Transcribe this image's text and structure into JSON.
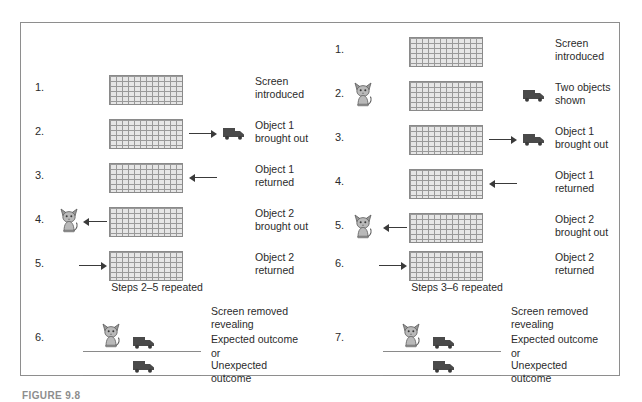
{
  "figure": {
    "caption": "FIGURE 9.8",
    "border_color": "#8e8e8e",
    "background": "#ffffff",
    "ink_color": "#2b2b2b",
    "object_color": "#4a4a4a",
    "screen_fill": "#e6e6e6"
  },
  "panels": [
    {
      "id": "left",
      "name": "one-object-sequence",
      "steps": [
        {
          "num": "1.",
          "caption": "Screen\nintroduced",
          "has_screen": true,
          "has_cat": false,
          "arrow": "none",
          "has_truck": false
        },
        {
          "num": "2.",
          "caption": "Object 1\nbrought out",
          "has_screen": true,
          "has_cat": false,
          "arrow": "out-right",
          "has_truck": true
        },
        {
          "num": "3.",
          "caption": "Object 1\nreturned",
          "has_screen": true,
          "has_cat": false,
          "arrow": "in-left",
          "has_truck": false
        },
        {
          "num": "4.",
          "caption": "Object 2\nbrought out",
          "has_screen": true,
          "has_cat": true,
          "arrow": "out-left",
          "has_truck": false
        },
        {
          "num": "5.",
          "caption": "Object 2\nreturned",
          "has_screen": true,
          "has_cat": false,
          "arrow": "in-right",
          "has_truck": false
        }
      ],
      "repeat_note": "Steps 2–5 repeated",
      "outcome": {
        "num": "6.",
        "caption_top": "Screen removed\nrevealing",
        "caption_expected": "Expected outcome",
        "caption_or": "or",
        "caption_unexpected": "Unexpected\noutcome",
        "expected_has_cat": true,
        "expected_has_truck": true,
        "unexpected_has_cat": false,
        "unexpected_has_truck": true
      }
    },
    {
      "id": "right",
      "name": "two-object-sequence",
      "steps": [
        {
          "num": "1.",
          "caption": "Screen\nintroduced",
          "has_screen": true,
          "has_cat": false,
          "arrow": "none",
          "has_truck": false
        },
        {
          "num": "2.",
          "caption": "Two objects\nshown",
          "has_screen": true,
          "has_cat": true,
          "arrow": "none",
          "has_truck": true
        },
        {
          "num": "3.",
          "caption": "Object 1\nbrought out",
          "has_screen": true,
          "has_cat": false,
          "arrow": "out-right",
          "has_truck": true
        },
        {
          "num": "4.",
          "caption": "Object 1\nreturned",
          "has_screen": true,
          "has_cat": false,
          "arrow": "in-left",
          "has_truck": false
        },
        {
          "num": "5.",
          "caption": "Object 2\nbrought out",
          "has_screen": true,
          "has_cat": true,
          "arrow": "out-left",
          "has_truck": false
        },
        {
          "num": "6.",
          "caption": "Object 2\nreturned",
          "has_screen": true,
          "has_cat": false,
          "arrow": "in-right",
          "has_truck": false
        }
      ],
      "repeat_note": "Steps 3–6 repeated",
      "outcome": {
        "num": "7.",
        "caption_top": "Screen removed\nrevealing",
        "caption_expected": "Expected outcome",
        "caption_or": "or",
        "caption_unexpected": "Unexpected\noutcome",
        "expected_has_cat": true,
        "expected_has_truck": true,
        "unexpected_has_cat": false,
        "unexpected_has_truck": true
      }
    }
  ],
  "icons": {
    "screen": "hatched-screen-icon",
    "cat": "cat-icon",
    "truck": "truck-icon",
    "arrow_right": "arrow-right-icon",
    "arrow_left": "arrow-left-icon"
  }
}
